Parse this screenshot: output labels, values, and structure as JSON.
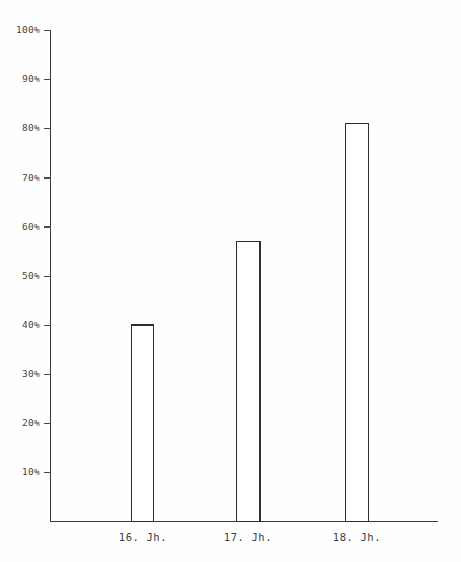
{
  "chart_data": {
    "type": "bar",
    "title": "",
    "subtitle": "",
    "xlabel": "",
    "ylabel": "",
    "categories": [
      "16. Jh.",
      "17. Jh.",
      "18. Jh."
    ],
    "values": [
      40,
      57,
      81
    ],
    "value_labels": [
      "40%",
      "57%",
      "81%"
    ],
    "ylim": [
      0,
      100
    ],
    "yticks": [
      10,
      20,
      30,
      40,
      50,
      60,
      70,
      80,
      90,
      100
    ],
    "ytick_labels": [
      "10%",
      "20%",
      "30%",
      "40%",
      "50%",
      "60%",
      "70%",
      "80%",
      "90%",
      "100%"
    ],
    "grid": false,
    "legend": null,
    "legend_position": "none",
    "bar_style": {
      "fill": "#ffffff",
      "stroke": "#2e2e2e"
    },
    "axis_color": "#3a3a3a",
    "background": "#fefefe",
    "annotations": []
  },
  "axis": {
    "y_top_label": "100%",
    "y_bottom_label": "10%"
  },
  "x_labels": {
    "0": "16. Jh.",
    "1": "17. Jh.",
    "2": "18. Jh."
  },
  "y_labels": {
    "0": "100%",
    "1": "90%",
    "2": "80%",
    "3": "70%",
    "4": "60%",
    "5": "50%",
    "6": "40%",
    "7": "30%",
    "8": "20%",
    "9": "10%"
  }
}
